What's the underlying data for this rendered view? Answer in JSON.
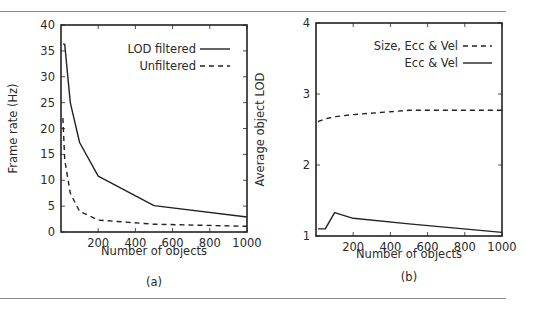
{
  "figure": {
    "rule_color": "#8a8a8a",
    "line_color": "#222222"
  },
  "chart_data": [
    {
      "id": "a",
      "type": "line",
      "caption": "(a)",
      "title": "",
      "xlabel": "Number of objects",
      "ylabel": "Frame rate (Hz)",
      "xlim": [
        0,
        1000
      ],
      "ylim": [
        0,
        40
      ],
      "xticks": [
        200,
        400,
        600,
        800,
        1000
      ],
      "yticks": [
        0,
        5,
        10,
        15,
        20,
        25,
        30,
        35,
        40
      ],
      "grid": false,
      "legend_position": "upper right",
      "series": [
        {
          "name": "LOD filtered",
          "style": "solid",
          "x": [
            10,
            20,
            50,
            100,
            200,
            500,
            1000
          ],
          "y": [
            36.3,
            36.3,
            25,
            17.3,
            10.8,
            5.1,
            2.9
          ]
        },
        {
          "name": "Unfiltered",
          "style": "dashed",
          "x": [
            10,
            20,
            50,
            100,
            200,
            500,
            1000
          ],
          "y": [
            22,
            14,
            7.5,
            4.0,
            2.3,
            1.5,
            1.1
          ]
        }
      ]
    },
    {
      "id": "b",
      "type": "line",
      "caption": "(b)",
      "title": "",
      "xlabel": "Number of objects",
      "ylabel": "Average object LOD",
      "xlim": [
        0,
        1000
      ],
      "ylim": [
        1,
        4
      ],
      "xticks": [
        200,
        400,
        600,
        800,
        1000
      ],
      "yticks": [
        1,
        2,
        3,
        4
      ],
      "grid": false,
      "legend_position": "upper right",
      "series": [
        {
          "name": "Size, Ecc & Vel",
          "style": "dashed",
          "x": [
            10,
            50,
            100,
            200,
            500,
            1000
          ],
          "y": [
            2.61,
            2.65,
            2.68,
            2.71,
            2.77,
            2.77
          ]
        },
        {
          "name": "Ecc & Vel",
          "style": "solid",
          "x": [
            10,
            50,
            100,
            200,
            500,
            1000
          ],
          "y": [
            1.1,
            1.1,
            1.33,
            1.25,
            1.17,
            1.05
          ]
        }
      ]
    }
  ]
}
